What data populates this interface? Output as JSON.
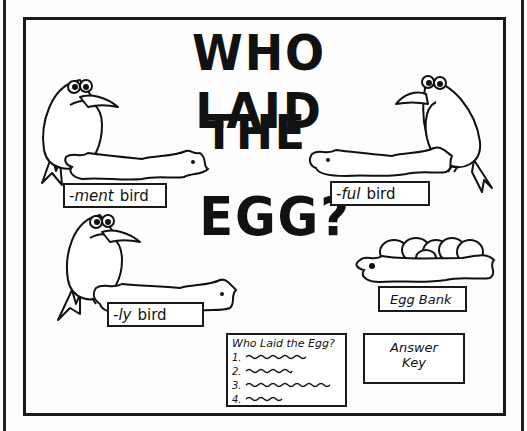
{
  "title": {
    "line1": "WHO LAID",
    "line2": "THE",
    "line3": "EGG?"
  },
  "birds": [
    {
      "suffix": "-ment",
      "word": "bird",
      "position": "top-left",
      "facing": "right"
    },
    {
      "suffix": "-ful",
      "word": "bird",
      "position": "top-right",
      "facing": "left"
    },
    {
      "suffix": "-ly",
      "word": "bird",
      "position": "bottom-left",
      "facing": "right"
    }
  ],
  "egg_bank": {
    "label": "Egg Bank",
    "egg_count": 6
  },
  "worksheet": {
    "heading": "Who Laid the Egg?",
    "items": [
      "1.",
      "2.",
      "3.",
      "4."
    ]
  },
  "answer_key": {
    "line1": "Answer",
    "line2": "Key"
  },
  "colors": {
    "ink": "#111111",
    "paper": "#fdfdfd"
  }
}
